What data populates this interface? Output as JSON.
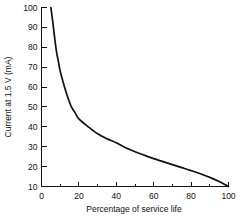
{
  "chart_data": {
    "type": "line",
    "title": "",
    "xlabel": "Percentage of service life",
    "ylabel": "Current at 1.5 V (mA)",
    "xlim": [
      0,
      100
    ],
    "ylim": [
      10,
      100
    ],
    "grid": false,
    "legend": false,
    "x_ticks": [
      0,
      20,
      40,
      60,
      80,
      100
    ],
    "x_tick_labels": [
      "0",
      "20",
      "40",
      "60",
      "80",
      "100"
    ],
    "x_minor_ticks": [
      10,
      30,
      50,
      70,
      90
    ],
    "y_ticks": [
      10,
      20,
      30,
      40,
      50,
      60,
      70,
      80,
      90,
      100
    ],
    "y_tick_labels": [
      "10",
      "20",
      "30",
      "40",
      "50",
      "60",
      "70",
      "80",
      "90",
      "100"
    ],
    "series": [
      {
        "name": "Current at 1.5 V",
        "color": "#111111",
        "x": [
          5,
          6,
          7,
          8,
          9,
          10,
          12,
          14,
          16,
          18,
          20,
          25,
          30,
          35,
          40,
          45,
          50,
          55,
          60,
          65,
          70,
          75,
          80,
          85,
          90,
          95,
          100
        ],
        "values": [
          100,
          93,
          85,
          78,
          73,
          68,
          61,
          55,
          50,
          47,
          44,
          40,
          36.5,
          34,
          32,
          29.5,
          27.5,
          25.7,
          24,
          22.5,
          21,
          19.5,
          18,
          16.4,
          14.6,
          12.5,
          10
        ]
      }
    ]
  },
  "axis_titles": {
    "x": "Percentage of service life",
    "y": "Current at 1.5 V (mA)"
  }
}
